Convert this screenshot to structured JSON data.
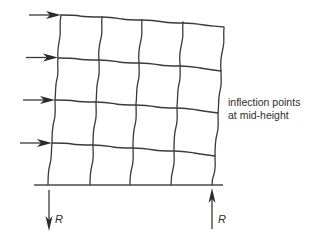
{
  "figure": {
    "type": "portal frame under lateral load",
    "stroke_color": "#3a3a3a",
    "background": "#ffffff",
    "stories": 4,
    "bays": 4
  },
  "annotation": {
    "line1": "inflection points",
    "line2": "at mid-height"
  },
  "reactions": {
    "left": {
      "label": "R",
      "direction": "down"
    },
    "right": {
      "label": "R",
      "direction": "up"
    }
  },
  "lateral_loads": [
    {
      "level": 1,
      "direction": "right"
    },
    {
      "level": 2,
      "direction": "right"
    },
    {
      "level": 3,
      "direction": "right"
    },
    {
      "level": 4,
      "direction": "right"
    }
  ]
}
